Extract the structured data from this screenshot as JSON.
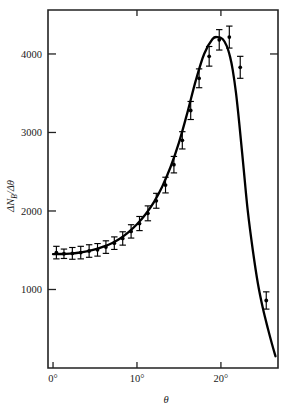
{
  "figure": {
    "name": "angular-distribution-plot",
    "background_color": "#ffffff",
    "line_color": "#000000",
    "axis_color": "#222222"
  },
  "axes": {
    "x_label": "θ",
    "y_label_prefix": "ΔN",
    "y_label_sub": "B",
    "y_label_suffix": "/Δθ",
    "x_ticks": [
      {
        "value": 0,
        "label": "0°"
      },
      {
        "value": 10,
        "label": "10°"
      },
      {
        "value": 20,
        "label": "20°"
      }
    ],
    "y_ticks": [
      {
        "value": 1000,
        "label": "1000"
      },
      {
        "value": 2000,
        "label": "2000"
      },
      {
        "value": 3000,
        "label": "3000"
      },
      {
        "value": 4000,
        "label": "4000"
      }
    ],
    "xlim": [
      -0.6,
      26.8
    ],
    "ylim": [
      0,
      4560
    ],
    "grid": false
  },
  "chart_data": {
    "type": "line",
    "title": "",
    "subtitle": "",
    "xlabel": "θ",
    "ylabel": "ΔN_B/Δθ",
    "xlim": [
      -0.6,
      26.8
    ],
    "ylim": [
      0,
      4560
    ],
    "grid": false,
    "legend": "none",
    "x_tick_labels": [
      "0°",
      "10°",
      "20°"
    ],
    "y_tick_labels": [
      "1000",
      "2000",
      "3000",
      "4000"
    ],
    "series": [
      {
        "name": "fitted curve",
        "type": "line",
        "x": [
          0.0,
          1.0,
          2.0,
          3.0,
          4.0,
          5.0,
          6.0,
          7.0,
          8.0,
          9.0,
          10.0,
          11.0,
          12.0,
          13.0,
          14.0,
          15.0,
          16.0,
          17.0,
          18.0,
          19.0,
          19.6,
          20.2,
          20.7,
          21.1,
          21.4,
          21.8,
          22.2,
          22.7,
          23.2,
          23.8,
          24.4,
          25.0,
          25.6,
          26.1,
          26.5
        ],
        "values": [
          1450,
          1452,
          1458,
          1468,
          1485,
          1510,
          1545,
          1590,
          1650,
          1730,
          1830,
          1955,
          2110,
          2310,
          2560,
          2870,
          3250,
          3660,
          4000,
          4190,
          4215,
          4190,
          4100,
          3960,
          3800,
          3500,
          3100,
          2550,
          2000,
          1500,
          1080,
          760,
          500,
          300,
          150
        ]
      },
      {
        "name": "measured counts",
        "type": "scatter",
        "x": [
          0.4,
          1.3,
          2.3,
          3.3,
          4.3,
          5.3,
          6.3,
          7.3,
          8.3,
          9.3,
          10.3,
          11.3,
          12.3,
          13.4,
          14.4,
          15.4,
          16.4,
          17.4,
          18.6,
          19.8,
          21.0,
          22.3,
          25.4
        ],
        "values": [
          1470,
          1455,
          1460,
          1470,
          1490,
          1505,
          1540,
          1590,
          1650,
          1740,
          1840,
          1970,
          2130,
          2330,
          2590,
          2900,
          3280,
          3690,
          3970,
          4180,
          4215,
          3830,
          860
        ],
        "yerr": [
          80,
          60,
          75,
          80,
          80,
          80,
          80,
          80,
          85,
          85,
          90,
          95,
          95,
          100,
          105,
          110,
          115,
          120,
          125,
          130,
          140,
          140,
          110
        ]
      }
    ]
  }
}
